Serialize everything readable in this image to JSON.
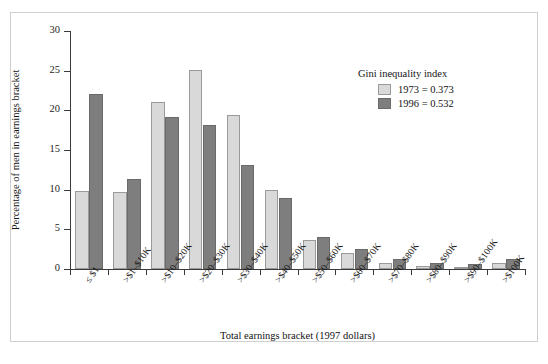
{
  "chart_data": {
    "type": "bar",
    "title": "",
    "xlabel": "Total earnings bracket (1997 dollars)",
    "ylabel": "Percentage of men in earnings bracket",
    "ylim": [
      0,
      30
    ],
    "yticks": [
      0,
      5,
      10,
      15,
      20,
      25,
      30
    ],
    "grid": false,
    "legend_position": "upper-right",
    "legend_title": "Gini inequality index",
    "categories": [
      "≤ $1",
      ">$1–$10K",
      ">$10–$20K",
      ">$20–$30K",
      ">$30–$40K",
      ">$40–$50K",
      ">$50–$60K",
      ">$60–$70K",
      ">$70–$80K",
      ">$80–$90K",
      ">$90–$100K",
      ">$100K"
    ],
    "series": [
      {
        "name": "1973 = 0.373",
        "color": "#d9d9d9",
        "values": [
          9.8,
          9.7,
          21.0,
          25.1,
          19.4,
          10.0,
          3.7,
          2.0,
          0.8,
          0.4,
          0.2,
          0.8
        ]
      },
      {
        "name": "1996 = 0.532",
        "color": "#7e7e7e",
        "values": [
          22.1,
          11.3,
          19.2,
          18.2,
          13.1,
          8.9,
          4.0,
          2.5,
          1.2,
          0.8,
          0.6,
          1.3
        ]
      }
    ]
  },
  "legend": {
    "title": "Gini inequality index",
    "entries": [
      {
        "label": "1973 = 0.373",
        "swatch": "light-gray"
      },
      {
        "label": "1996 = 0.532",
        "swatch": "dark-gray"
      }
    ]
  },
  "axes": {
    "y_title": "Percentage of men in earnings bracket",
    "x_title": "Total earnings bracket (1997 dollars)"
  }
}
